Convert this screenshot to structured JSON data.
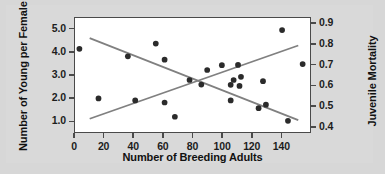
{
  "chart_data": {
    "type": "scatter",
    "title": "",
    "xlabel": "Number of Breeding Adults",
    "ylabel": "Number of Young per Female",
    "y2label": "Juvenile Mortality",
    "xlim": [
      0,
      160
    ],
    "ylim": [
      0.5,
      5.5
    ],
    "y2lim": [
      0.37,
      0.93
    ],
    "xticks": [
      0,
      20,
      40,
      60,
      80,
      100,
      120,
      140
    ],
    "xticklabels": [
      "0",
      "20",
      "40",
      "60",
      "80",
      "100",
      "120",
      "140"
    ],
    "yticks": [
      1.0,
      2.0,
      3.0,
      4.0,
      5.0
    ],
    "yticklabels": [
      "1.0",
      "2.0",
      "3.0",
      "4.0",
      "5.0"
    ],
    "y2ticks": [
      0.4,
      0.5,
      0.6,
      0.7,
      0.8,
      0.9
    ],
    "y2ticklabels": [
      "0.4",
      "0.5",
      "0.6",
      "0.7",
      "0.8",
      "0.9"
    ],
    "grid": false,
    "legend": false,
    "series": [
      {
        "name": "Number of Young per Female",
        "axis": "left",
        "marker": "filled-circle",
        "color": "#2b2b2b",
        "points": [
          [
            3,
            4.15
          ],
          [
            36,
            3.82
          ],
          [
            55,
            4.38
          ],
          [
            61,
            3.67
          ],
          [
            78,
            2.78
          ],
          [
            86,
            2.58
          ],
          [
            90,
            3.22
          ],
          [
            100,
            3.43
          ],
          [
            106,
            2.57
          ],
          [
            108,
            2.78
          ],
          [
            111,
            3.44
          ],
          [
            112,
            2.52
          ],
          [
            113,
            2.92
          ],
          [
            128,
            2.73
          ],
          [
            141,
            4.97
          ],
          [
            155,
            3.48
          ]
        ]
      },
      {
        "name": "Juvenile Mortality",
        "axis": "right",
        "marker": "filled-circle",
        "color": "#2b2b2b",
        "points": [
          [
            16,
            0.535
          ],
          [
            41,
            0.525
          ],
          [
            61,
            0.515
          ],
          [
            68,
            0.445
          ],
          [
            106,
            0.525
          ],
          [
            125,
            0.487
          ],
          [
            130,
            0.504
          ],
          [
            145,
            0.425
          ]
        ]
      }
    ],
    "trendlines": [
      {
        "name": "young-per-female-trend",
        "axis": "left",
        "color": "#808080",
        "from": [
          10,
          4.62
        ],
        "to": [
          152,
          1.02
        ]
      },
      {
        "name": "juvenile-mortality-trend",
        "axis": "right",
        "color": "#808080",
        "from": [
          10,
          0.435
        ],
        "to": [
          152,
          0.795
        ]
      }
    ]
  }
}
